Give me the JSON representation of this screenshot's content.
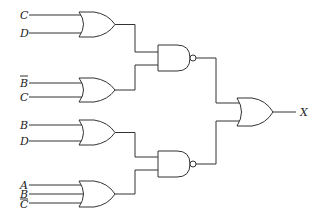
{
  "diagram": {
    "type": "logic-circuit",
    "inputs": {
      "or1": [
        "C",
        "D"
      ],
      "or2": [
        "B",
        "C"
      ],
      "or3": [
        "B",
        "D"
      ],
      "or4": [
        "A",
        "B",
        "C"
      ]
    },
    "inverted_inputs": {
      "or2": [
        true,
        false
      ],
      "or4": [
        false,
        false,
        true
      ]
    },
    "gates": [
      {
        "id": "or1",
        "type": "OR",
        "inputs": [
          "C",
          "D"
        ]
      },
      {
        "id": "or2",
        "type": "OR",
        "inputs": [
          "B'",
          "C"
        ]
      },
      {
        "id": "or3",
        "type": "OR",
        "inputs": [
          "B",
          "D"
        ]
      },
      {
        "id": "or4",
        "type": "OR",
        "inputs": [
          "A",
          "B",
          "C'"
        ]
      },
      {
        "id": "nand1",
        "type": "NAND",
        "inputs": [
          "or1",
          "or2"
        ]
      },
      {
        "id": "nand2",
        "type": "NAND",
        "inputs": [
          "or3",
          "or4"
        ]
      },
      {
        "id": "or5",
        "type": "OR",
        "inputs": [
          "nand1",
          "nand2"
        ],
        "output": "X"
      }
    ],
    "output_label": "X"
  }
}
